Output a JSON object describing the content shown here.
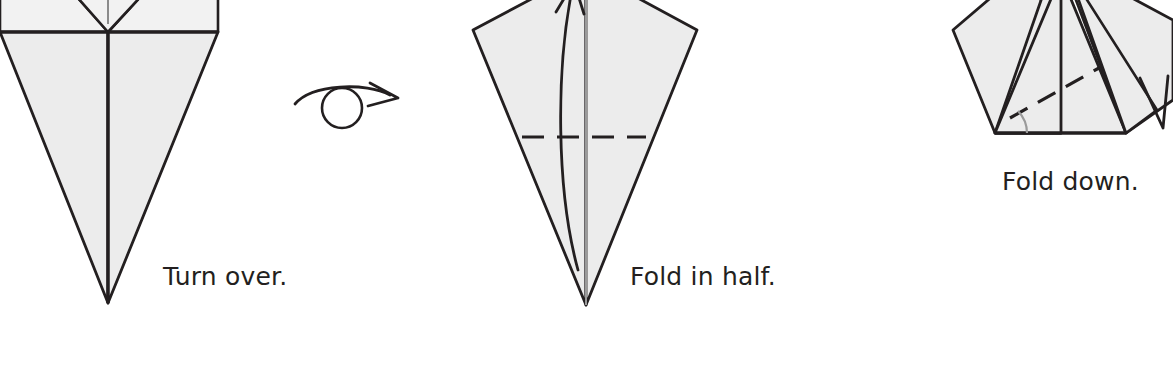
{
  "page": {
    "background_color": "#ffffff",
    "width": 1173,
    "height": 384
  },
  "style": {
    "paper_fill": "#ececec",
    "paper_fill_light": "#f2f2f2",
    "line_color": "#231f20",
    "text_color": "#231f20",
    "crease_color": "#231f20"
  },
  "steps": [
    {
      "id": "step-turn-over",
      "caption": "Turn over.",
      "figure_name": "kite-base-front",
      "symbol": "turn-over-arrow",
      "crease_lines": 0,
      "description": "Inverted kite shape with vertical center crease, partially cropped at top."
    },
    {
      "id": "step-fold-in-half",
      "caption": "Fold in half.",
      "figure_name": "kite-base-back",
      "symbol": "valley-fold-dashed-line",
      "crease_lines": 1,
      "description": "Kite shape with horizontal dashed valley fold line and upward curved fold arrow."
    },
    {
      "id": "step-fold-down",
      "caption": "Fold down.",
      "figure_name": "folded-flaps",
      "symbol": "diagonal-dashed-fold-line",
      "crease_lines": 1,
      "description": "Pentagon shape with diagonal dashed fold line, angle arc marker and fold arrow at right."
    }
  ],
  "captions": {
    "turn_over": "Turn over.",
    "fold_in_half": "Fold in half.",
    "fold_down": "Fold down."
  }
}
